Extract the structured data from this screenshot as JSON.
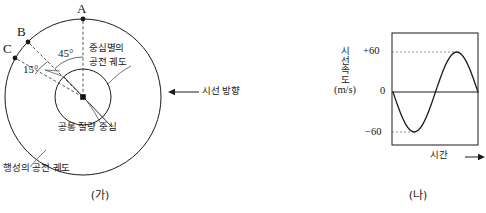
{
  "figure": {
    "left": {
      "caption": "(가)",
      "points": [
        {
          "id": "A",
          "label": "A"
        },
        {
          "id": "B",
          "label": "B"
        },
        {
          "id": "C",
          "label": "C"
        }
      ],
      "angles": [
        {
          "id": "angle-ab",
          "label": "45°"
        },
        {
          "id": "angle-bc",
          "label": "15°"
        }
      ],
      "annotations": {
        "star_orbit": "중심별의\n공전 궤도",
        "star_orbit_line1": "중심별의",
        "star_orbit_line2": "공전 궤도",
        "barycenter": "공통 질량 중심",
        "planet_orbit": "행성의 공전 궤도",
        "line_of_sight": "시선 방향"
      }
    },
    "right": {
      "caption": "(나)",
      "axis": {
        "ylabel_chars": [
          "시",
          "선",
          "속",
          "도"
        ],
        "yunit": "(m/s)",
        "xlabel": "시간",
        "xarrow": "→"
      },
      "ticks": [
        {
          "label": "+60",
          "value": 60
        },
        {
          "label": "0",
          "value": 0
        },
        {
          "label": "−60",
          "value": -60
        }
      ]
    }
  },
  "chart_data": {
    "type": "line",
    "title": "",
    "xlabel": "시간",
    "ylabel": "시선 속도 (m/s)",
    "yunit": "m/s",
    "ylim": [
      -75,
      75
    ],
    "xlim": [
      0,
      1
    ],
    "ytick_labels": [
      "+60",
      "0",
      "−60"
    ],
    "ytick_values": [
      60,
      0,
      -60
    ],
    "xtick_labels": [],
    "grid": false,
    "legend": null,
    "gridline_style": "dotted-leader-to-peak",
    "series": [
      {
        "name": "시선 속도",
        "description": "negative sine, one full period",
        "x": [
          0.0,
          0.05,
          0.1,
          0.15,
          0.2,
          0.25,
          0.3,
          0.35,
          0.4,
          0.45,
          0.5,
          0.55,
          0.6,
          0.65,
          0.7,
          0.75,
          0.8,
          0.85,
          0.9,
          0.95,
          1.0
        ],
        "y": [
          0,
          -18.5,
          -35.3,
          -48.5,
          -57.1,
          -60,
          -57.1,
          -48.5,
          -35.3,
          -18.5,
          0,
          18.5,
          35.3,
          48.5,
          57.1,
          60,
          57.1,
          48.5,
          35.3,
          18.5,
          0
        ]
      }
    ],
    "annotations": [
      {
        "text": "+60",
        "y": 60
      },
      {
        "text": "−60",
        "y": -60
      }
    ]
  },
  "colors": {
    "stroke": "#1a1a1a",
    "dashed": "#555555",
    "background": "#ffffff"
  }
}
